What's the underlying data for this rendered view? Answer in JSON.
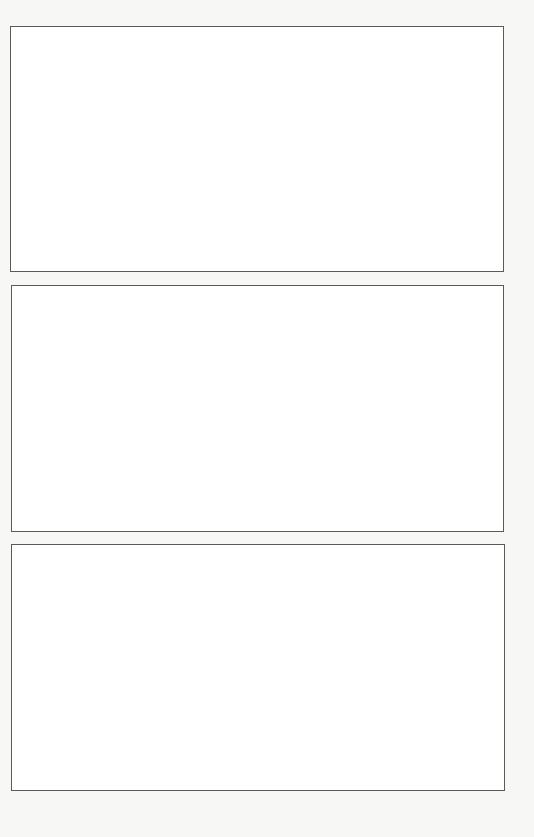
{
  "page": {
    "background": "#f7f7f6",
    "border_color": "#5a5a5a"
  },
  "panels": [
    {
      "label": ""
    },
    {
      "label": ""
    },
    {
      "label": ""
    }
  ]
}
